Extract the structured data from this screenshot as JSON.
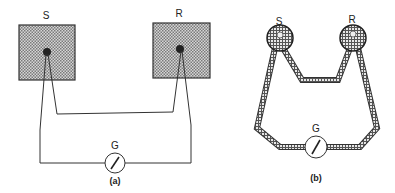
{
  "figure_a": {
    "caption": "(a)",
    "left_block_label": "S",
    "right_block_label": "R",
    "meter_label": "G"
  },
  "figure_b": {
    "caption": "(b)",
    "left_junction_label": "S",
    "right_junction_label": "R",
    "meter_label": "G"
  },
  "colors": {
    "line": "#333333",
    "block_fill": "#b8b8b8",
    "background": "#ffffff"
  }
}
